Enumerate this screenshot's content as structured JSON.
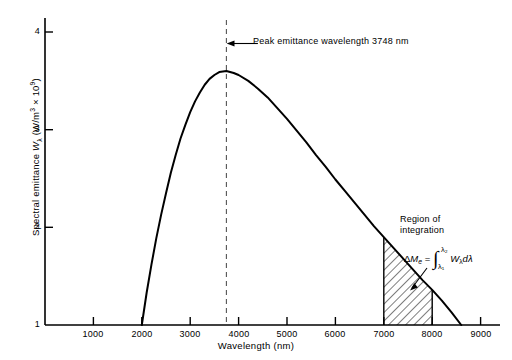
{
  "chart_data": {
    "type": "line",
    "title": "",
    "xlabel": "Wavelength (nm)",
    "ylabel": "Spectral emittance Wλ (W/m³ × 10⁹)",
    "ylabel_parts": {
      "prefix": "Spectral emittance ",
      "symbol": "W",
      "symbol_sub": "λ",
      "units_open": " (W/m",
      "units_exp": "3",
      "units_mid": " × 10",
      "units_exp2": "9",
      "units_close": ")"
    },
    "xlim": [
      0,
      9500
    ],
    "ylim": [
      1,
      4.35
    ],
    "xticks": [
      1000,
      2000,
      3000,
      4000,
      5000,
      6000,
      7000,
      8000,
      9000
    ],
    "xtick_labels": [
      "1000",
      "2000",
      "3000",
      "4000",
      "5000",
      "6000",
      "7000",
      "8000",
      "9000"
    ],
    "yticks": [
      1,
      2,
      3,
      4
    ],
    "ytick_labels": [
      "1",
      "2",
      "3",
      "4"
    ],
    "grid": false,
    "legend": false,
    "x": [
      2000,
      2100,
      2200,
      2300,
      2400,
      2500,
      2600,
      2700,
      2800,
      2900,
      3000,
      3100,
      3200,
      3300,
      3400,
      3500,
      3600,
      3748,
      3900,
      4000,
      4200,
      4400,
      4600,
      4800,
      5000,
      5200,
      5400,
      5600,
      5800,
      6000,
      6200,
      6400,
      6600,
      6800,
      7000,
      7200,
      7400,
      7600,
      7800,
      8000,
      8200,
      8400,
      8600
    ],
    "y": [
      1.0,
      1.33,
      1.62,
      1.89,
      2.13,
      2.35,
      2.56,
      2.74,
      2.91,
      3.05,
      3.18,
      3.29,
      3.38,
      3.46,
      3.52,
      3.56,
      3.59,
      3.6,
      3.58,
      3.56,
      3.5,
      3.42,
      3.33,
      3.22,
      3.11,
      2.99,
      2.87,
      2.74,
      2.62,
      2.49,
      2.37,
      2.25,
      2.13,
      2.01,
      1.9,
      1.79,
      1.68,
      1.57,
      1.46,
      1.36,
      1.25,
      1.13,
      1.0
    ],
    "peak": {
      "wavelength": 3748,
      "value": 3.6,
      "label": "Peak emittance wavelength 3748 nm",
      "marker": "vertical-dashed-line"
    },
    "shaded_region": {
      "label_line1": "Region of",
      "label_line2": "integration",
      "x_start": 7000,
      "x_end": 8000,
      "hatch": "diagonal",
      "formula": {
        "delta": "Δ",
        "m_symbol": "M",
        "m_sub": "e",
        "equals": "=",
        "integral": "∫",
        "upper_limit": "λ₂",
        "lower_limit": "λ₁",
        "integrand": "W",
        "integrand_sub": "λ",
        "differential": "dλ",
        "plain": "ΔMₑ = ∫(λ₁..λ₂) Wλ dλ"
      }
    },
    "colors": {
      "curve": "#000000",
      "axis": "#000000",
      "dashed": "#555555",
      "hatch": "#000000",
      "background": "#ffffff"
    }
  }
}
